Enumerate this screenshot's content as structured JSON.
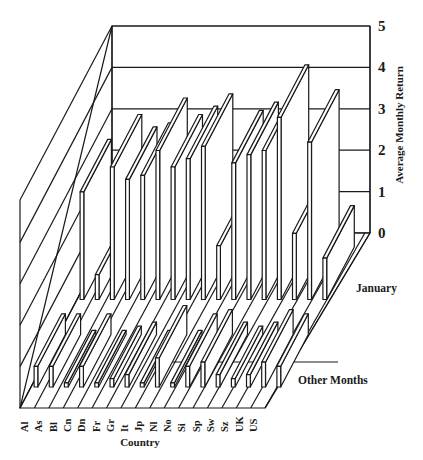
{
  "chart_data": {
    "type": "bar",
    "subtype": "3d-grouped-bar",
    "title": "",
    "xlabel": "Country",
    "ylabel": "Average Monthly Return",
    "zlabel_rows": [
      "January",
      "Other Months"
    ],
    "ylim": [
      0,
      5
    ],
    "yticks": [
      "0",
      "1",
      "2",
      "3",
      "4",
      "5"
    ],
    "grid": true,
    "legend": null,
    "categories": [
      "Al",
      "As",
      "Bl",
      "Cn",
      "Dn",
      "Fr",
      "Gr",
      "It",
      "Jp",
      "Nl",
      "No",
      "Si",
      "Sp",
      "Sw",
      "Sz",
      "UK",
      "US"
    ],
    "series": [
      {
        "name": "January",
        "values": [
          2.6,
          0.6,
          3.2,
          2.9,
          3.0,
          3.6,
          3.2,
          3.4,
          3.7,
          1.3,
          3.3,
          3.5,
          3.6,
          4.4,
          1.6,
          3.8,
          1.0
        ]
      },
      {
        "name": "Other Months",
        "values": [
          0.5,
          0.5,
          0.1,
          0.5,
          0.1,
          0.2,
          0.3,
          0.1,
          0.7,
          0.1,
          0.5,
          0.6,
          0.3,
          0.2,
          0.3,
          0.6,
          0.5
        ]
      }
    ]
  },
  "labels": {
    "y_axis_title": "Average Monthly Return",
    "x_axis_title": "Country",
    "row_january": "January",
    "row_other": "Other Months"
  }
}
